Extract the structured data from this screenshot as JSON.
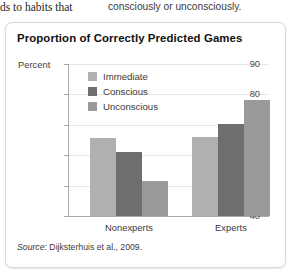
{
  "page_text": {
    "left_fragment": "ds to habits that",
    "right_fragment": "consciously or unconsciously."
  },
  "figure": {
    "title": "Proportion of Correctly Predicted Games",
    "source_word": "Source:",
    "source_text": " Dijksterhuis et al., 2009."
  },
  "chart_data": {
    "type": "bar",
    "title": "Proportion of Correctly Predicted Games",
    "xlabel": "",
    "ylabel": "Percent",
    "categories": [
      "Nonexperts",
      "Experts"
    ],
    "series": [
      {
        "name": "Immediate",
        "values": [
          65.5,
          66.0
        ],
        "color": "#b0b0b0"
      },
      {
        "name": "Conscious",
        "values": [
          61.0,
          70.3
        ],
        "color": "#6e6e6e"
      },
      {
        "name": "Unconscious",
        "values": [
          51.5,
          78.3
        ],
        "color": "#9a9a9a"
      }
    ],
    "ylim": [
      40,
      90
    ],
    "yticks": [
      90,
      80,
      70,
      60,
      50,
      40
    ],
    "ytick_labels": [
      "90",
      "80",
      "70",
      "60",
      "50",
      "40"
    ],
    "grid": true,
    "legend_position": "inside-upper-left",
    "axis_color": "#a9a9a9",
    "grid_color": "#e6e6e6"
  }
}
